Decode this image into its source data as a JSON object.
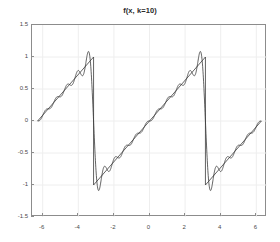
{
  "chart_data": {
    "type": "line",
    "title": "f(x, k=10)",
    "xlabel": "",
    "ylabel": "",
    "xlim": [
      -6.6,
      6.6
    ],
    "ylim": [
      -1.5,
      1.5
    ],
    "xticks": [
      -6,
      -4,
      -2,
      0,
      2,
      4,
      6
    ],
    "xtick_labels": [
      "-6",
      "-4",
      "-2",
      "0",
      "2",
      "4",
      "6"
    ],
    "yticks": [
      -1.5,
      -1,
      -0.5,
      0,
      0.5,
      1,
      1.5
    ],
    "ytick_labels": [
      "-1.5",
      "-1",
      "-0.5",
      "0",
      "0.5",
      "1",
      "1.5"
    ],
    "grid": true,
    "legend": null,
    "line_color": "#3a3a3a",
    "grid_color": "#eeeeee",
    "axis_color": "#8c8c8c",
    "background": "#ffffff",
    "series": [
      {
        "name": "sawtooth (ideal)",
        "kind": "piecewise-linear",
        "comment": "f(x) = x/pi on each period, jumps from +1 to -1 at x = -pi and x = +pi",
        "points": [
          [
            -6.2832,
            0.0
          ],
          [
            -3.1416,
            1.0
          ],
          [
            -3.1416,
            -1.0
          ],
          [
            0.0,
            0.0
          ],
          [
            3.1416,
            1.0
          ],
          [
            3.1416,
            -1.0
          ],
          [
            6.2832,
            0.0
          ]
        ]
      },
      {
        "name": "Fourier partial sum k=10",
        "kind": "fourier-sine-partial-sum",
        "formula": "(2/pi) * sum_{n=1}^{10} ((-1)^(n+1)/n) * sin(n*x)",
        "harmonics": 10,
        "overshoot_peak": 1.09,
        "undershoot_min": -1.09,
        "x_range": [
          -6.2832,
          6.2832
        ],
        "samples": 1200
      }
    ]
  }
}
